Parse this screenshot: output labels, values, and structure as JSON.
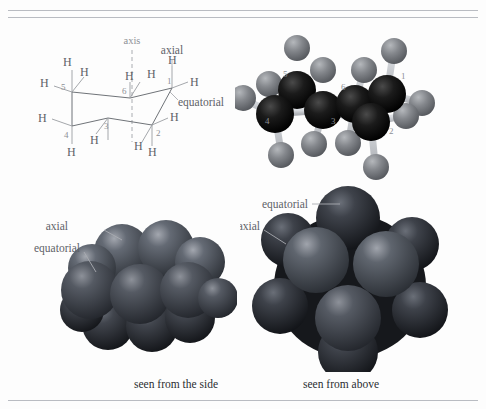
{
  "figure": {
    "background_color": "#fdfdfd",
    "rule_color": "#b9bcc2"
  },
  "colors": {
    "line": "#6f7378",
    "hydrogen_line": "#9a9da2",
    "label": "#5e6268",
    "number": "#8d9096",
    "carbon_ball": "#111111",
    "hydrogen_ball": "#7d8084",
    "bond_stick": "#c9ccd0",
    "sphere_dark": "#3c3f46",
    "sphere_mid": "#4e525a",
    "caption": "#2a2d31"
  },
  "chair_diagram": {
    "name": "chair-conformation-line-drawing",
    "axis_label": "axis",
    "axial_label": "axial",
    "equatorial_label": "equatorial",
    "hydrogen_symbol": "H",
    "carbon_numbers": [
      "1",
      "2",
      "3",
      "4",
      "5",
      "6"
    ],
    "hydrogen_labels": [
      {
        "id": "h-c5-axial",
        "text": "H",
        "x": 33,
        "y": 29
      },
      {
        "id": "h-c5-equatorial",
        "text": "H",
        "x": 8,
        "y": 56
      },
      {
        "id": "h-c6-axial-up",
        "text": "H",
        "x": 47,
        "y": 41
      },
      {
        "id": "h-c6-equatorial",
        "text": "H",
        "x": 96,
        "y": 41
      },
      {
        "id": "h-c1-axial",
        "text": "H",
        "x": 129,
        "y": 29
      },
      {
        "id": "h-c1-equatorial",
        "text": "H",
        "x": 160,
        "y": 55
      },
      {
        "id": "h-c4-equatorial",
        "text": "H",
        "x": 2,
        "y": 92
      },
      {
        "id": "h-c4-axial",
        "text": "H",
        "x": 28,
        "y": 119
      },
      {
        "id": "h-c3-axial-dn",
        "text": "H",
        "x": 50,
        "y": 116
      },
      {
        "id": "h-c2-equatorial",
        "text": "H",
        "x": 132,
        "y": 91
      },
      {
        "id": "h-c2-axial",
        "text": "H",
        "x": 103,
        "y": 116
      },
      {
        "id": "h-c2-axial-2",
        "text": "H",
        "x": 118,
        "y": 122
      }
    ],
    "number_labels": [
      {
        "id": "num-5",
        "text": "5",
        "x": 29,
        "y": 50
      },
      {
        "id": "num-6",
        "text": "6",
        "x": 90,
        "y": 55
      },
      {
        "id": "num-1",
        "text": "1",
        "x": 130,
        "y": 50
      },
      {
        "id": "num-4",
        "text": "4",
        "x": 27,
        "y": 106
      },
      {
        "id": "num-3",
        "text": "3",
        "x": 63,
        "y": 94
      },
      {
        "id": "num-2",
        "text": "2",
        "x": 117,
        "y": 106
      }
    ]
  },
  "ball_stick_model": {
    "name": "ball-and-stick-model",
    "carbon_numbers": [
      {
        "id": "bs-num-5",
        "text": "5",
        "x": 52,
        "y": 46
      },
      {
        "id": "bs-num-1",
        "text": "1",
        "x": 167,
        "y": 48
      },
      {
        "id": "bs-num-6",
        "text": "6",
        "x": 107,
        "y": 59
      },
      {
        "id": "bs-num-4",
        "text": "4",
        "x": 34,
        "y": 92
      },
      {
        "id": "bs-num-3",
        "text": "3",
        "x": 98,
        "y": 92
      },
      {
        "id": "bs-num-2",
        "text": "2",
        "x": 155,
        "y": 101
      }
    ]
  },
  "space_filling_side": {
    "name": "space-filling-model-side-view",
    "axial_label": "axial",
    "equatorial_label": "equatorial",
    "caption": "seen from the side"
  },
  "space_filling_above": {
    "name": "space-filling-model-top-view",
    "equatorial_label": "equatorial",
    "axial_label": "axial",
    "caption": "seen from above"
  }
}
